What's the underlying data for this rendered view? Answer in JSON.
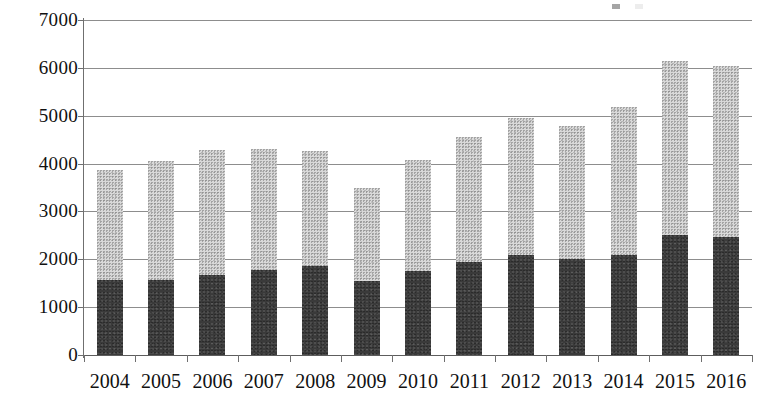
{
  "chart_data": {
    "type": "bar",
    "subtype": "stacked-column",
    "title": "",
    "subtitle": "",
    "xlabel": "",
    "ylabel": "",
    "categories": [
      "2004",
      "2005",
      "2006",
      "2007",
      "2008",
      "2009",
      "2010",
      "2011",
      "2012",
      "2013",
      "2014",
      "2015",
      "2016"
    ],
    "series": [
      {
        "name": "Series 1",
        "color": "#3a3a3a",
        "values": [
          1570,
          1570,
          1680,
          1770,
          1850,
          1540,
          1760,
          1950,
          2090,
          2000,
          2100,
          2500,
          2460
        ]
      },
      {
        "name": "Series 2",
        "color": "#d9d9d9",
        "values": [
          2290,
          2480,
          2600,
          2530,
          2420,
          1940,
          2320,
          2600,
          2860,
          2790,
          3090,
          3650,
          3570
        ]
      }
    ],
    "totals": [
      3860,
      4050,
      4280,
      4300,
      4270,
      3480,
      4080,
      4550,
      4950,
      4790,
      5190,
      6150,
      6030
    ],
    "ylim": [
      0,
      7000
    ],
    "ytick_values": [
      0,
      1000,
      2000,
      3000,
      4000,
      5000,
      6000,
      7000
    ],
    "ytick_labels": [
      "0",
      "1000",
      "2000",
      "3000",
      "4000",
      "5000",
      "6000",
      "7000"
    ],
    "grid": true,
    "grid_axis": "y",
    "legend_position": "top-right",
    "legend_cropped": true
  },
  "legend": {
    "entries": [
      {
        "label": "",
        "color": "#3a3a3a"
      },
      {
        "label": "",
        "color": "#d9d9d9"
      }
    ]
  },
  "colors": {
    "background": "#ffffff",
    "gridline": "#8d8d8d",
    "axis": "#6f6f6f",
    "text": "#111111",
    "series_dark": "#3a3a3a",
    "series_light": "#d9d9d9"
  }
}
